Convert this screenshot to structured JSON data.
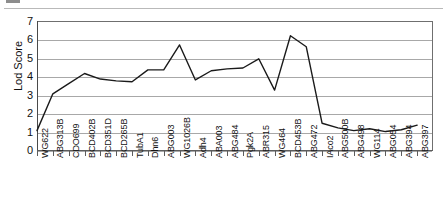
{
  "figure": {
    "kind": "scanned-line-chart",
    "background_color": "#ffffff",
    "line_color": "#1a1a1a",
    "grid_color": "#a8a8a8",
    "axis_color": "#5d5d5d"
  },
  "chart_data": {
    "type": "line",
    "title": "",
    "xlabel": "",
    "ylabel": "Lod Score",
    "ylim": [
      0,
      7
    ],
    "yticks": [
      0,
      1,
      2,
      3,
      4,
      5,
      6,
      7
    ],
    "grid": true,
    "legend": null,
    "categories": [
      "WG622",
      "ABG313B",
      "CDO699",
      "BCD402B",
      "BCD351D",
      "BCD265B",
      "TubA1",
      "Dhn6",
      "ABG003",
      "WG1026B",
      "Adh4",
      "ABA003",
      "ABG484",
      "Pgk2A",
      "ABR315",
      "WG464",
      "BCD453B",
      "ABG472",
      "IAco2",
      "ABG500B",
      "ABG498",
      "WG114",
      "ABG054",
      "ABG394",
      "ABG397"
    ],
    "values": [
      1.05,
      3.05,
      3.6,
      4.15,
      3.85,
      3.75,
      3.7,
      4.35,
      4.35,
      5.7,
      3.8,
      4.3,
      4.4,
      4.45,
      4.95,
      3.25,
      6.2,
      5.6,
      1.45,
      1.2,
      1.05,
      1.15,
      1.0,
      1.1,
      1.35
    ]
  }
}
